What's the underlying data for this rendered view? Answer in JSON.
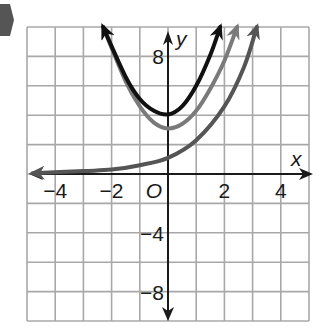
{
  "chart_data": {
    "type": "line",
    "title": "",
    "xlabel": "x",
    "ylabel": "y",
    "origin_label": "O",
    "xlim": [
      -5,
      5
    ],
    "ylim": [
      -10,
      10
    ],
    "grid": true,
    "x_ticks": [
      {
        "value": -4,
        "label": "−4"
      },
      {
        "value": -2,
        "label": "−2"
      },
      {
        "value": 2,
        "label": "2"
      },
      {
        "value": 4,
        "label": "4"
      }
    ],
    "y_ticks": [
      {
        "value": 8,
        "label": "8"
      },
      {
        "value": -4,
        "label": "−4"
      },
      {
        "value": -8,
        "label": "−8"
      }
    ],
    "series": [
      {
        "name": "black curve",
        "color": "#111111",
        "points": [
          [
            -2.3,
            10
          ],
          [
            -1.5,
            6.6
          ],
          [
            -1,
            5.1
          ],
          [
            -0.5,
            4.3
          ],
          [
            0,
            4.05
          ],
          [
            0.5,
            4.6
          ],
          [
            1,
            6
          ],
          [
            1.5,
            8.1
          ],
          [
            1.85,
            10
          ]
        ]
      },
      {
        "name": "gray curve",
        "color": "#7a7a7a",
        "points": [
          [
            -2.3,
            10
          ],
          [
            -1.5,
            6.3
          ],
          [
            -1,
            4.6
          ],
          [
            -0.5,
            3.5
          ],
          [
            0,
            3.1
          ],
          [
            0.5,
            3.4
          ],
          [
            1,
            4.3
          ],
          [
            1.5,
            5.8
          ],
          [
            2,
            7.7
          ],
          [
            2.45,
            10
          ]
        ]
      },
      {
        "name": "dark gray exponential",
        "color": "#555555",
        "points": [
          [
            -4.8,
            0.05
          ],
          [
            -3,
            0.2
          ],
          [
            -2,
            0.3
          ],
          [
            -1,
            0.6
          ],
          [
            0,
            1.1
          ],
          [
            1,
            2.3
          ],
          [
            2,
            4.6
          ],
          [
            2.7,
            7.3
          ],
          [
            3.15,
            10
          ]
        ]
      }
    ]
  },
  "decoration": {
    "marker_color": "#555555"
  }
}
